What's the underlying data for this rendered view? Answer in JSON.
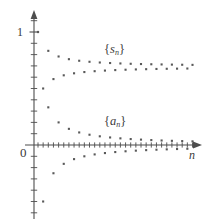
{
  "figure": {
    "axis_color": "#4d4d4d",
    "point_color": "#595959",
    "background": "#ffffff"
  },
  "labels": {
    "y_one": "1",
    "origin": "0",
    "x_axis": "n",
    "series_partial_sums_brace_open": "{",
    "series_partial_sums_symbol": "s",
    "series_partial_sums_subscript": "n",
    "series_partial_sums_brace_close": "}",
    "series_terms_brace_open": "{",
    "series_terms_symbol": "a",
    "series_terms_subscript": "n",
    "series_terms_brace_close": "}"
  },
  "chart_data": {
    "type": "scatter",
    "title": "",
    "xlabel": "n",
    "ylabel": "",
    "grid": false,
    "legend": "inline-annotations",
    "annotations": [
      {
        "text": "{s_n}",
        "x": 13.5,
        "y": 0.845
      },
      {
        "text": "{a_n}",
        "x": 13.5,
        "y": 0.205
      }
    ],
    "xlim": [
      0,
      32
    ],
    "ylim": [
      -1.15,
      1.18
    ],
    "y_ticks_major": [
      0,
      1
    ],
    "y_tick_labels": [
      "0",
      "1"
    ],
    "y_minor_tick_step": 0.1,
    "x_tick_step": 1,
    "series": [
      {
        "name": "{a_n}",
        "formula": "a_n = (-1)^(n+1)/n",
        "x": [
          1,
          2,
          3,
          4,
          5,
          6,
          7,
          8,
          9,
          10,
          11,
          12,
          13,
          14,
          15,
          16,
          17,
          18,
          19,
          20,
          21,
          22,
          23,
          24,
          25,
          26,
          27,
          28,
          29,
          30,
          31
        ],
        "values": [
          1,
          -0.5,
          0.3333,
          -0.25,
          0.2,
          -0.1667,
          0.1429,
          -0.125,
          0.1111,
          -0.1,
          0.0909,
          -0.0833,
          0.0769,
          -0.0714,
          0.0667,
          -0.0625,
          0.0588,
          -0.0556,
          0.0526,
          -0.05,
          0.0476,
          -0.0455,
          0.0435,
          -0.0417,
          0.04,
          -0.0385,
          0.037,
          -0.0357,
          0.0345,
          -0.0333,
          0.0323
        ]
      },
      {
        "name": "{s_n}",
        "formula": "s_n = sum of a_k for k=1..n",
        "x": [
          1,
          2,
          3,
          4,
          5,
          6,
          7,
          8,
          9,
          10,
          11,
          12,
          13,
          14,
          15,
          16,
          17,
          18,
          19,
          20,
          21,
          22,
          23,
          24,
          25,
          26,
          27,
          28,
          29,
          30,
          31
        ],
        "values": [
          1,
          0.5,
          0.8333,
          0.5833,
          0.7833,
          0.6167,
          0.7595,
          0.6345,
          0.7456,
          0.6456,
          0.7365,
          0.6532,
          0.7301,
          0.6587,
          0.7254,
          0.6629,
          0.7217,
          0.6662,
          0.7188,
          0.6688,
          0.7165,
          0.671,
          0.7145,
          0.6729,
          0.7129,
          0.6744,
          0.7114,
          0.6757,
          0.7102,
          0.6768,
          0.7091
        ]
      }
    ]
  }
}
